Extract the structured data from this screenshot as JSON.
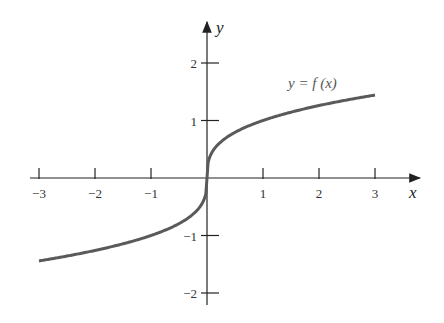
{
  "chart_data": {
    "type": "line",
    "title": "",
    "xlabel": "x",
    "ylabel": "y",
    "xlim": [
      -3,
      3
    ],
    "ylim": [
      -2,
      2
    ],
    "grid": false,
    "x_ticks": [
      -3,
      -2,
      -1,
      1,
      2,
      3
    ],
    "y_ticks": [
      -2,
      -1,
      1,
      2
    ],
    "x_tick_labels": [
      "−3",
      "−2",
      "−1",
      "1",
      "2",
      "3"
    ],
    "y_tick_labels": [
      "−2",
      "−1",
      "1",
      "2"
    ],
    "series": [
      {
        "name": "y = f(x)",
        "function": "cube root",
        "x": [
          -3,
          -2,
          -1,
          -0.5,
          -0.1,
          0,
          0.1,
          0.5,
          1,
          2,
          3
        ],
        "values": [
          -1.44,
          -1.26,
          -1.0,
          -0.79,
          -0.46,
          0,
          0.46,
          0.79,
          1.0,
          1.26,
          1.44
        ]
      }
    ],
    "annotations": [
      {
        "text": "y = f (x)",
        "x": 2.2,
        "y": 1.7
      }
    ],
    "colors": {
      "curve": "#5a5a5a",
      "axes": "#222222"
    }
  }
}
